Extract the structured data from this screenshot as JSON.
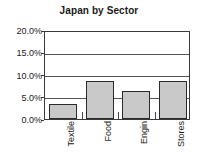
{
  "chart_data": {
    "type": "bar",
    "title": "Japan by Sector",
    "xlabel": "",
    "ylabel": "",
    "categories": [
      "Textile",
      "Food",
      "Engin",
      "Stores"
    ],
    "values": [
      3.4,
      8.5,
      6.4,
      8.6
    ],
    "value_labels": [
      "3.4%",
      "8.5%",
      "6.4%",
      "8.6%"
    ],
    "ylim": [
      0,
      20
    ],
    "ytick_values": [
      0,
      5,
      10,
      15,
      20
    ],
    "ytick_labels": [
      "0.0%",
      "5.0%",
      "10.0%",
      "15.0%",
      "20.0%"
    ],
    "grid": true,
    "grid_axis": "y",
    "legend": false,
    "legend_position": "none",
    "bar_fill_color": "#c9c9c9",
    "bar_border_color": "#2b2b2b",
    "axis_color": "#3a3a3a",
    "gridline_color": "#555555",
    "text_color": "#1a1a1a",
    "background_color": "#ffffff",
    "xtick_label_rotation": -90
  }
}
